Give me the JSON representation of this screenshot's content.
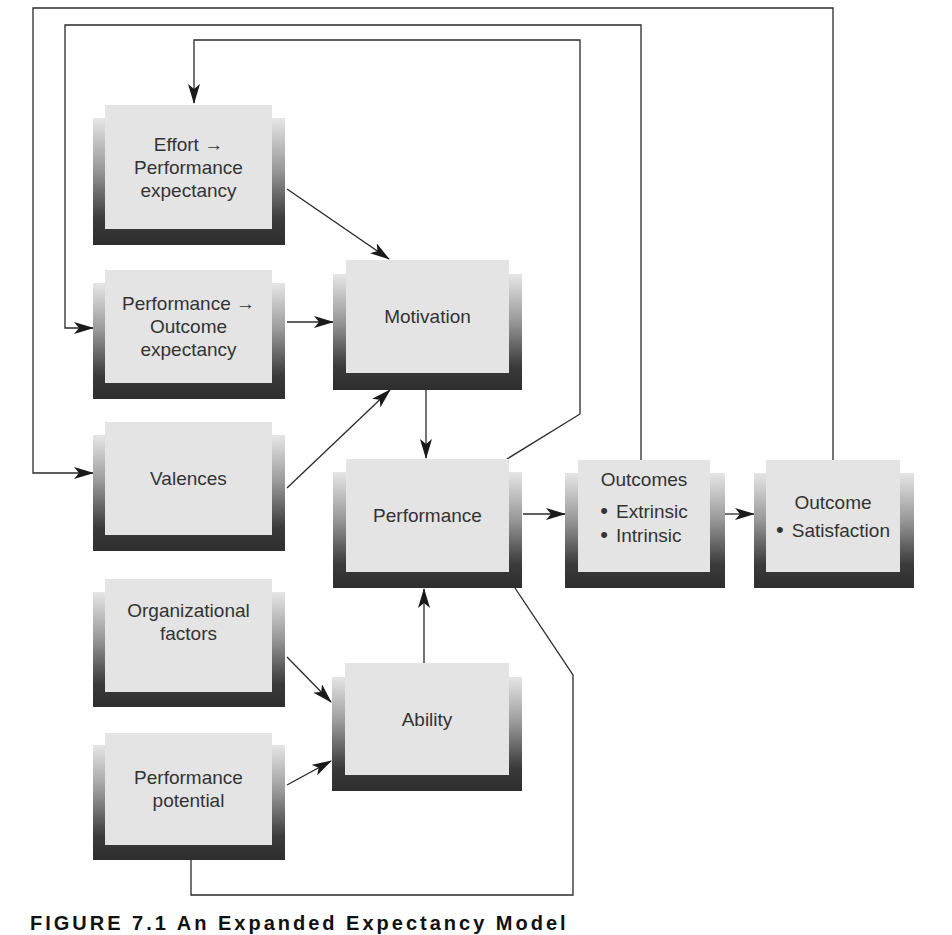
{
  "figure": {
    "boxes": {
      "effort_performance": {
        "lines": [
          "Effort →",
          "Performance",
          "expectancy"
        ]
      },
      "performance_outcome": {
        "lines": [
          "Performance →",
          "Outcome",
          "expectancy"
        ]
      },
      "valences": {
        "lines": [
          "Valences"
        ]
      },
      "motivation": {
        "lines": [
          "Motivation"
        ]
      },
      "performance": {
        "lines": [
          "Performance"
        ]
      },
      "outcomes": {
        "title": "Outcomes",
        "bullets": [
          "Extrinsic",
          "Intrinsic"
        ]
      },
      "outcome_satisfaction": {
        "title": "Outcome",
        "bullets": [
          "Satisfaction"
        ]
      },
      "organizational_factors": {
        "lines": [
          "Organizational",
          "factors"
        ]
      },
      "ability": {
        "lines": [
          "Ability"
        ]
      },
      "performance_potential": {
        "lines": [
          "Performance",
          "potential"
        ]
      }
    },
    "edges": [
      {
        "from": "effort_performance",
        "to": "motivation"
      },
      {
        "from": "performance_outcome",
        "to": "motivation"
      },
      {
        "from": "valences",
        "to": "motivation"
      },
      {
        "from": "motivation",
        "to": "performance"
      },
      {
        "from": "performance",
        "to": "outcomes"
      },
      {
        "from": "outcomes",
        "to": "outcome_satisfaction"
      },
      {
        "from": "organizational_factors",
        "to": "ability"
      },
      {
        "from": "performance_potential",
        "to": "ability"
      },
      {
        "from": "ability",
        "to": "performance"
      },
      {
        "from": "performance",
        "to": "effort_performance",
        "kind": "feedback"
      },
      {
        "from": "outcomes",
        "to": "performance_outcome",
        "kind": "feedback"
      },
      {
        "from": "outcome_satisfaction",
        "to": "valences",
        "kind": "feedback"
      },
      {
        "from": "performance_potential",
        "to": "performance",
        "kind": "feedback-line"
      }
    ],
    "caption": "FIGURE 7.1  An Expanded Expectancy Model"
  }
}
